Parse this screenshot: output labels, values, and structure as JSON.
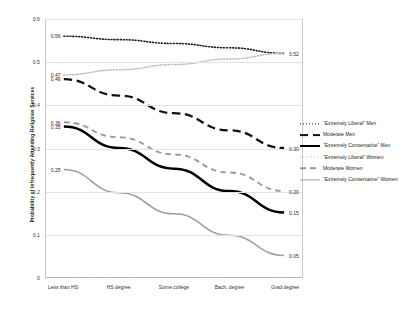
{
  "chart_data": {
    "type": "line",
    "title": "",
    "xlabel": "",
    "ylabel": "Probability of Infrequently Attending Religious Services",
    "categories": [
      "Less than HS",
      "HS degree",
      "Some college",
      "Bach. degree",
      "Grad degree"
    ],
    "ylim": [
      0,
      0.6
    ],
    "yticks": [
      "0",
      "0.1",
      "0.2",
      "0.3",
      "0.4",
      "0.5",
      "0.6"
    ],
    "ytick_values": [
      0,
      0.1,
      0.2,
      0.3,
      0.4,
      0.5,
      0.6
    ],
    "grid": "horizontal",
    "legend_position": "right",
    "series": [
      {
        "name": "“Extremely Liberal” Men",
        "values": [
          0.56,
          0.552,
          0.543,
          0.533,
          0.52
        ],
        "start_label": "0.56",
        "end_label": "0.52",
        "color": "#1a1a1a",
        "style": "dotted",
        "width": 1.6
      },
      {
        "name": "Moderate Men",
        "values": [
          0.46,
          0.422,
          0.381,
          0.341,
          0.3
        ],
        "start_label": "0.46",
        "end_label": "0.30",
        "color": "#111111",
        "style": "longdash",
        "width": 2.3
      },
      {
        "name": "“Extremely Conservative” Men",
        "values": [
          0.35,
          0.3,
          0.252,
          0.2,
          0.15
        ],
        "start_label": "0.35",
        "end_label": "0.15",
        "color": "#000000",
        "style": "solid",
        "width": 2.5
      },
      {
        "name": "“Extremely Liberal” Women",
        "values": [
          0.47,
          0.482,
          0.494,
          0.507,
          0.52
        ],
        "start_label": "0.47",
        "end_label": "",
        "color": "#b9b9b9",
        "style": "dotted",
        "width": 1.5
      },
      {
        "name": "Moderate Women",
        "values": [
          0.36,
          0.325,
          0.285,
          0.243,
          0.2
        ],
        "start_label": "0.36",
        "end_label": "0.20",
        "color": "#9a9a9a",
        "style": "dashed",
        "width": 1.9
      },
      {
        "name": "“Extremely Conservative” Women",
        "values": [
          0.25,
          0.196,
          0.147,
          0.097,
          0.05
        ],
        "start_label": "0.25",
        "end_label": "0.05",
        "color": "#9f9f9f",
        "style": "solid",
        "width": 1.6
      }
    ]
  }
}
